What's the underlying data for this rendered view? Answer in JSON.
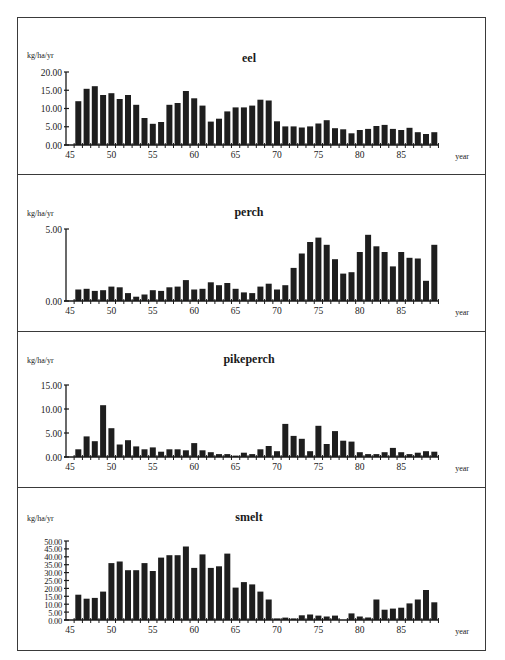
{
  "chart_data": [
    {
      "type": "bar",
      "title": "eel",
      "ylabel": "kg/ha/yr",
      "xlabel": "year",
      "ylim": [
        0,
        20
      ],
      "yticks": [
        "0.00",
        "5.00",
        "10.00",
        "15.00",
        "20.00"
      ],
      "xticks": [
        "45",
        "50",
        "55",
        "60",
        "65",
        "70",
        "75",
        "80",
        "85"
      ],
      "categories": [
        46,
        47,
        48,
        49,
        50,
        51,
        52,
        53,
        54,
        55,
        56,
        57,
        58,
        59,
        60,
        61,
        62,
        63,
        64,
        65,
        66,
        67,
        68,
        69,
        70,
        71,
        72,
        73,
        74,
        75,
        76,
        77,
        78,
        79,
        80,
        81,
        82,
        83,
        84,
        85,
        86,
        87,
        88,
        89
      ],
      "values": [
        12.0,
        15.4,
        16.1,
        13.7,
        14.2,
        12.6,
        13.7,
        11.0,
        7.4,
        5.8,
        6.3,
        11.0,
        11.5,
        14.8,
        12.8,
        10.8,
        6.4,
        7.2,
        9.2,
        10.3,
        10.3,
        10.8,
        12.4,
        12.2,
        6.5,
        5.1,
        5.1,
        4.8,
        5.1,
        5.9,
        6.8,
        4.6,
        4.3,
        3.2,
        4.1,
        4.4,
        5.2,
        5.5,
        4.4,
        4.1,
        4.7,
        3.5,
        3.0,
        3.5
      ]
    },
    {
      "type": "bar",
      "title": "perch",
      "ylabel": "kg/ha/yr",
      "xlabel": "year",
      "ylim": [
        0,
        5
      ],
      "yticks": [
        "0.00",
        "5.00"
      ],
      "xticks": [
        "45",
        "50",
        "55",
        "60",
        "65",
        "70",
        "75",
        "80",
        "85"
      ],
      "categories": [
        46,
        47,
        48,
        49,
        50,
        51,
        52,
        53,
        54,
        55,
        56,
        57,
        58,
        59,
        60,
        61,
        62,
        63,
        64,
        65,
        66,
        67,
        68,
        69,
        70,
        71,
        72,
        73,
        74,
        75,
        76,
        77,
        78,
        79,
        80,
        81,
        82,
        83,
        84,
        85,
        86,
        87,
        88,
        89
      ],
      "values": [
        0.8,
        0.85,
        0.7,
        0.75,
        1.0,
        0.95,
        0.55,
        0.3,
        0.45,
        0.75,
        0.7,
        0.95,
        1.0,
        1.45,
        0.8,
        0.85,
        1.3,
        1.1,
        1.25,
        0.85,
        0.6,
        0.55,
        1.0,
        1.2,
        0.8,
        1.1,
        2.3,
        3.3,
        4.1,
        4.4,
        3.9,
        2.9,
        1.9,
        2.0,
        3.4,
        4.6,
        3.8,
        3.4,
        2.4,
        3.4,
        3.0,
        2.95,
        1.4,
        3.9
      ]
    },
    {
      "type": "bar",
      "title": "pikeperch",
      "ylabel": "kg/ha/yr",
      "xlabel": "year",
      "ylim": [
        0,
        15
      ],
      "yticks": [
        "0.00",
        "5.00",
        "10.00",
        "15.00"
      ],
      "xticks": [
        "45",
        "50",
        "55",
        "60",
        "65",
        "70",
        "75",
        "80",
        "85"
      ],
      "categories": [
        46,
        47,
        48,
        49,
        50,
        51,
        52,
        53,
        54,
        55,
        56,
        57,
        58,
        59,
        60,
        61,
        62,
        63,
        64,
        65,
        66,
        67,
        68,
        69,
        70,
        71,
        72,
        73,
        74,
        75,
        76,
        77,
        78,
        79,
        80,
        81,
        82,
        83,
        84,
        85,
        86,
        87,
        88,
        89
      ],
      "values": [
        1.6,
        4.3,
        3.3,
        10.8,
        6.0,
        2.6,
        3.5,
        2.2,
        1.6,
        2.0,
        1.1,
        1.6,
        1.6,
        1.4,
        2.9,
        1.4,
        1.0,
        0.6,
        0.6,
        0.3,
        0.9,
        0.6,
        1.6,
        2.3,
        1.2,
        6.9,
        4.4,
        3.8,
        1.2,
        6.5,
        2.7,
        5.4,
        3.4,
        3.2,
        1.0,
        0.6,
        0.6,
        1.0,
        1.9,
        1.0,
        0.6,
        0.9,
        1.2,
        1.1
      ]
    },
    {
      "type": "bar",
      "title": "smelt",
      "ylabel": "kg/ha/yr",
      "xlabel": "year",
      "ylim": [
        0,
        50
      ],
      "yticks": [
        "0.00",
        "5.00",
        "10.00",
        "15.00",
        "20.00",
        "25.00",
        "30.00",
        "35.00",
        "40.00",
        "45.00",
        "50.00"
      ],
      "xticks": [
        "45",
        "50",
        "55",
        "60",
        "65",
        "70",
        "75",
        "80",
        "85"
      ],
      "categories": [
        46,
        47,
        48,
        49,
        50,
        51,
        52,
        53,
        54,
        55,
        56,
        57,
        58,
        59,
        60,
        61,
        62,
        63,
        64,
        65,
        66,
        67,
        68,
        69,
        70,
        71,
        72,
        73,
        74,
        75,
        76,
        77,
        78,
        79,
        80,
        81,
        82,
        83,
        84,
        85,
        86,
        87,
        88,
        89
      ],
      "values": [
        16,
        13.5,
        14,
        18,
        36,
        37,
        31.5,
        31.5,
        36,
        31,
        39.5,
        41,
        41,
        46.5,
        33,
        41.5,
        33,
        34,
        42,
        20.5,
        24,
        22.5,
        18,
        13,
        1,
        1.5,
        1,
        3,
        3.5,
        2.8,
        2.2,
        2.8,
        0,
        4.2,
        2.2,
        1.6,
        13,
        6.5,
        7.2,
        7.8,
        10.5,
        13,
        19,
        11.2
      ]
    }
  ],
  "colors": {
    "bar": "#1e1e1e",
    "axis": "#1a1a1a",
    "border": "#3a3a3a"
  }
}
